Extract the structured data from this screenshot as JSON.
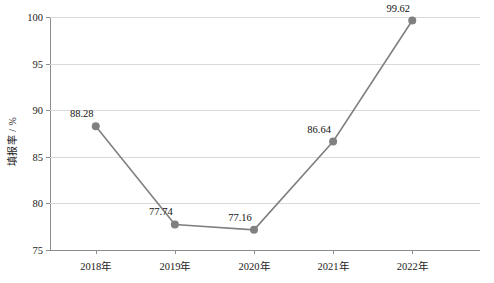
{
  "chart_data": {
    "type": "line",
    "title": "",
    "xlabel": "",
    "ylabel": "填报率 / %",
    "categories": [
      "2018年",
      "2019年",
      "2020年",
      "2021年",
      "2022年"
    ],
    "values": [
      88.28,
      77.74,
      77.16,
      86.64,
      99.62
    ],
    "point_labels": [
      "88.28",
      "77.74",
      "77.16",
      "86.64",
      "99.62"
    ],
    "ylim": [
      75,
      100
    ],
    "y_ticks": [
      75,
      80,
      85,
      90,
      95,
      100
    ],
    "y_tick_labels": [
      "75",
      "80",
      "85",
      "90",
      "95",
      "100"
    ],
    "grid": true,
    "legend": "none",
    "series_color": "#808080",
    "grid_color": "#d9d9d9",
    "axis_color": "#8c8c8c",
    "text_color": "#1a1a1a",
    "background_color": "#ffffff"
  }
}
